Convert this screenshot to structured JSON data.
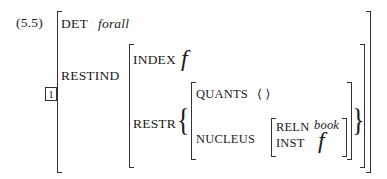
{
  "example_number": "(5.5)",
  "tag": "1",
  "avm": {
    "det_label": "DET",
    "det_value": "forall",
    "restind_label": "RESTIND",
    "index_label": "INDEX",
    "index_value": "f",
    "restr_label": "RESTR",
    "set_open": "{",
    "set_close": "}",
    "quants_label": "QUANTS",
    "quants_value": "⟨ ⟩",
    "nucleus_label": "NUCLEUS",
    "reln_label": "RELN",
    "reln_value": "book",
    "inst_label": "INST",
    "inst_value": "f"
  }
}
